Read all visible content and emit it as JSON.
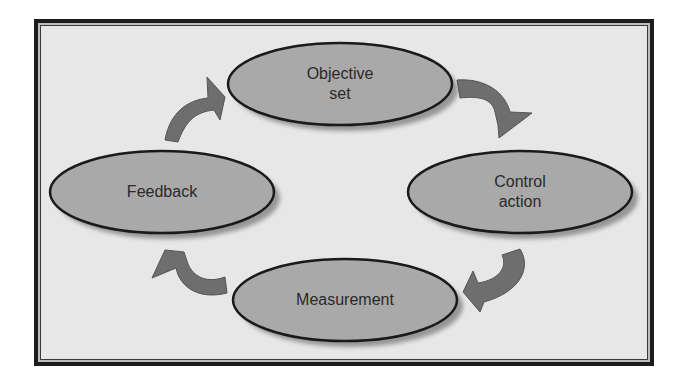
{
  "diagram": {
    "type": "cycle",
    "nodes": [
      {
        "id": "objective",
        "label_line1": "Objective",
        "label_line2": "set"
      },
      {
        "id": "control",
        "label_line1": "Control",
        "label_line2": "action"
      },
      {
        "id": "measurement",
        "label_line1": "Measurement",
        "label_line2": ""
      },
      {
        "id": "feedback",
        "label_line1": "Feedback",
        "label_line2": ""
      }
    ],
    "edges": [
      {
        "from": "objective",
        "to": "control"
      },
      {
        "from": "control",
        "to": "measurement"
      },
      {
        "from": "measurement",
        "to": "feedback"
      },
      {
        "from": "feedback",
        "to": "objective"
      }
    ],
    "colors": {
      "ellipse_fill": "#a9a9a9",
      "ellipse_stroke": "#1a1a1a",
      "arrow_fill": "#6e6e6e",
      "background": "#e7e7e7",
      "frame": "#1c1c1c"
    }
  }
}
